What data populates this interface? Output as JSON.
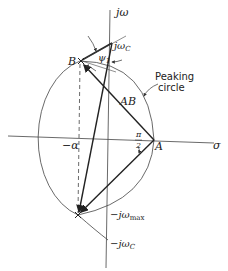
{
  "diagram": {
    "axes": {
      "vertical_label": "jω",
      "horizontal_label": "σ"
    },
    "points": {
      "A": "A",
      "B": "B",
      "jwc_top": "jω",
      "jwc_top_sub": "C",
      "minus_alpha": "−α",
      "minus_jwmax": "−jω",
      "minus_jwmax_sub": "max",
      "minus_jwc": "−jω",
      "minus_jwc_sub": "C"
    },
    "labels": {
      "AB": "AB",
      "psi": "ψ",
      "psi_sub": "1",
      "pi": "π",
      "two": "2",
      "peaking_line1": "Peaking",
      "peaking_line2": "circle"
    },
    "colors": {
      "ink": "#222222",
      "thin": "#444444"
    }
  }
}
